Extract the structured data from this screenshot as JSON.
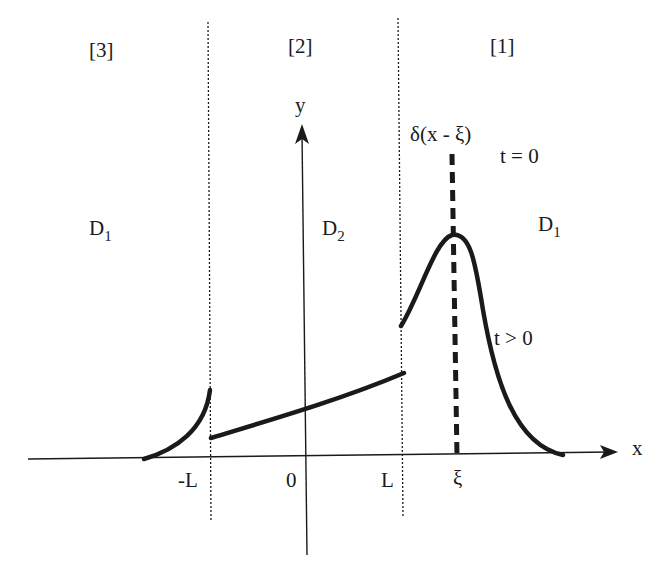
{
  "diagram": {
    "regions": [
      {
        "label": "[3]",
        "domain_label": "D",
        "domain_sub": "1"
      },
      {
        "label": "[2]",
        "domain_label": "D",
        "domain_sub": "2"
      },
      {
        "label": "[1]",
        "domain_label": "D",
        "domain_sub": "1"
      }
    ],
    "axes": {
      "x_label": "x",
      "y_label": "y"
    },
    "ticks": {
      "neg_L": "-L",
      "zero": "0",
      "L": "L",
      "xi": "ξ"
    },
    "annotations": {
      "delta": "δ(x - ξ)",
      "t_zero": "t = 0",
      "t_pos": "t > 0"
    },
    "colors": {
      "ink": "#1a1a1a",
      "background": "#ffffff"
    }
  }
}
